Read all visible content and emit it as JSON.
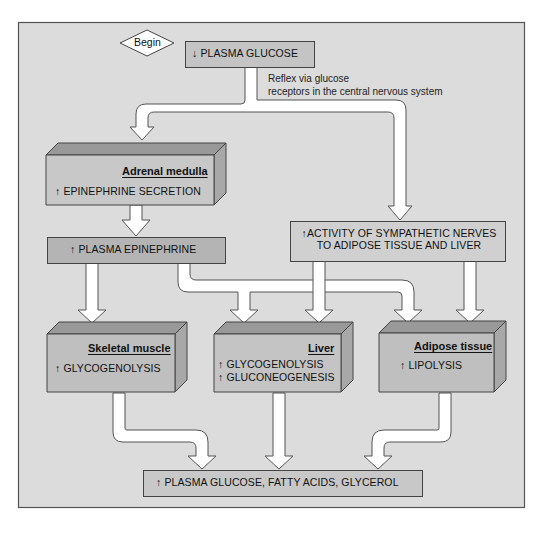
{
  "diagram": {
    "start": {
      "label": "Begin",
      "shape": "diamond"
    },
    "colors": {
      "background": "#dddddd",
      "frame_border": "#555555",
      "box_fill": "#c4c4c4",
      "box_dark_fill": "#b2b2b2",
      "box_top": "#9a9a9a",
      "box_side": "#a8a8a8",
      "pipe_fill": "#ffffff",
      "pipe_stroke": "#555555",
      "text": "#111111"
    },
    "nodes": {
      "plasma_glucose_low": {
        "arrow": "↓",
        "text": "PLASMA GLUCOSE"
      },
      "reflex_note": {
        "line1": "Reflex via glucose",
        "line2": "receptors in the central nervous system"
      },
      "adrenal_medulla": {
        "title": "Adrenal medulla",
        "arrow": "↑",
        "text": "EPINEPHRINE SECRETION"
      },
      "plasma_epinephrine": {
        "arrow": "↑",
        "text": "PLASMA EPINEPHRINE"
      },
      "sympathetic": {
        "arrow": "↑",
        "line1": "ACTIVITY OF SYMPATHETIC NERVES",
        "line2": "TO ADIPOSE TISSUE AND LIVER"
      },
      "skeletal_muscle": {
        "title": "Skeletal muscle",
        "arrow": "↑",
        "text": "GLYCOGENOLYSIS"
      },
      "liver": {
        "title": "Liver",
        "arrow1": "↑",
        "text1": "GLYCOGENOLYSIS",
        "arrow2": "↑",
        "text2": "GLUCONEOGENESIS"
      },
      "adipose_tissue": {
        "title": "Adipose tissue",
        "arrow": "↑",
        "text": "LIPOLYSIS"
      },
      "result": {
        "arrow": "↑",
        "text": "PLASMA GLUCOSE, FATTY ACIDS, GLYCEROL"
      }
    },
    "edges": [
      {
        "from": "plasma_glucose_low",
        "to": "adrenal_medulla"
      },
      {
        "from": "plasma_glucose_low",
        "to": "sympathetic"
      },
      {
        "from": "adrenal_medulla",
        "to": "plasma_epinephrine"
      },
      {
        "from": "plasma_epinephrine",
        "to": "skeletal_muscle"
      },
      {
        "from": "plasma_epinephrine",
        "to": "liver"
      },
      {
        "from": "plasma_epinephrine",
        "to": "adipose_tissue"
      },
      {
        "from": "sympathetic",
        "to": "liver"
      },
      {
        "from": "sympathetic",
        "to": "adipose_tissue"
      },
      {
        "from": "skeletal_muscle",
        "to": "result"
      },
      {
        "from": "liver",
        "to": "result"
      },
      {
        "from": "adipose_tissue",
        "to": "result"
      }
    ]
  }
}
